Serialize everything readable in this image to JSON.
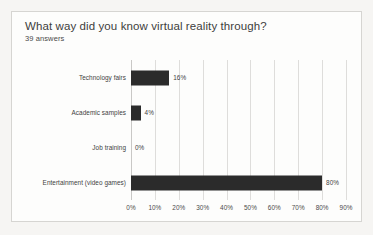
{
  "card": {
    "title": "What way did you know virtual reality through?",
    "subtitle": "39 answers"
  },
  "chart_data": {
    "type": "bar",
    "orientation": "horizontal",
    "title": "What way did you know virtual reality through?",
    "subtitle": "39 answers",
    "xlabel": "",
    "ylabel": "",
    "xlim": [
      0,
      90
    ],
    "grid": true,
    "legend": false,
    "bar_color": "#2b2b2b",
    "categories": [
      "Technology fairs",
      "Academic samples",
      "Job training",
      "Entertainment (video games)"
    ],
    "values": [
      16,
      4,
      0,
      80
    ],
    "value_labels": [
      "16%",
      "4%",
      "0%",
      "80%"
    ],
    "xticks": [
      0,
      10,
      20,
      30,
      40,
      50,
      60,
      70,
      80,
      90
    ],
    "xtick_labels": [
      "0%",
      "10%",
      "20%",
      "30%",
      "40%",
      "50%",
      "60%",
      "70%",
      "80%",
      "90%"
    ]
  }
}
